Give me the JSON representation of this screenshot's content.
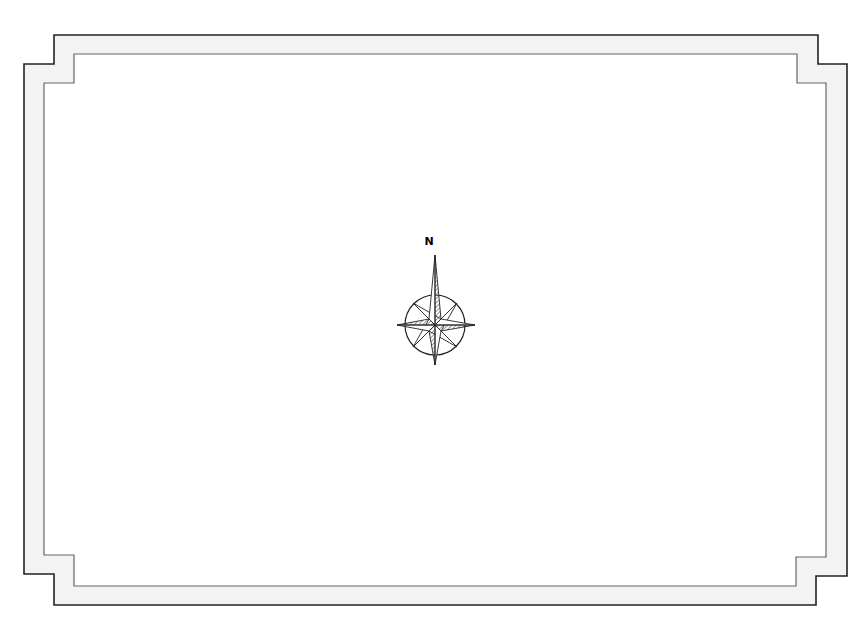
{
  "map": {
    "type": "blank map frame with compass rose",
    "background_color": "#ffffff",
    "frame": {
      "outer_border_color": "#222222",
      "inner_border_color": "#555555",
      "band_fill": "#f2f2f2",
      "style": "stepped notched corners"
    },
    "compass": {
      "north_label": "N",
      "center": [
        435,
        325
      ],
      "ring_radius": 30,
      "stroke_color": "#222222"
    }
  }
}
